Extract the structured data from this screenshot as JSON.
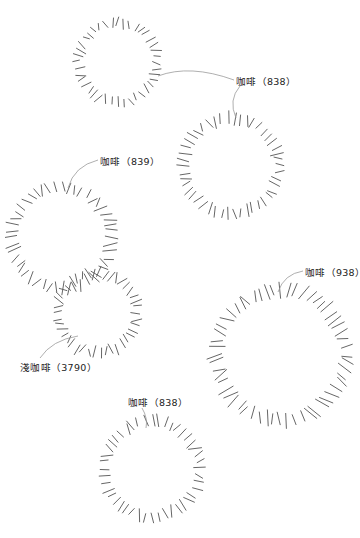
{
  "canvas": {
    "width": 360,
    "height": 538,
    "background": "#ffffff",
    "stroke": "#555555",
    "leader": "#9a9a9a"
  },
  "circles": [
    {
      "id": "c1",
      "cx": 118,
      "cy": 62,
      "r": 40,
      "ticks": 40,
      "len": 9
    },
    {
      "id": "c2",
      "cx": 231,
      "cy": 166,
      "r": 48,
      "ticks": 46,
      "len": 11
    },
    {
      "id": "c3",
      "cx": 62,
      "cy": 238,
      "r": 50,
      "ticks": 48,
      "len": 12
    },
    {
      "id": "c4",
      "cx": 97,
      "cy": 313,
      "r": 40,
      "ticks": 42,
      "len": 10
    },
    {
      "id": "c5",
      "cx": 281,
      "cy": 355,
      "r": 65,
      "ticks": 56,
      "len": 14
    },
    {
      "id": "c6",
      "cx": 152,
      "cy": 469,
      "r": 48,
      "ticks": 44,
      "len": 11
    }
  ],
  "labels": [
    {
      "id": "l1",
      "text": "咖啡（838）",
      "x": 236,
      "y": 74,
      "leaders": [
        {
          "d": "M158 76 Q190 64 234 80"
        },
        {
          "d": "M240 86 Q228 100 236 118"
        }
      ]
    },
    {
      "id": "l2",
      "text": "咖啡（839）",
      "x": 100,
      "y": 154,
      "leaders": [
        {
          "d": "M98 160 Q74 166 68 188"
        }
      ]
    },
    {
      "id": "l3",
      "text": "淺咖啡（3790）",
      "x": 20,
      "y": 360,
      "leaders": [
        {
          "d": "M40 358 Q52 340 78 336"
        }
      ]
    },
    {
      "id": "l4",
      "text": "咖啡（938）",
      "x": 305,
      "y": 265,
      "leaders": [
        {
          "d": "M303 271 Q284 274 278 292"
        }
      ]
    },
    {
      "id": "l5",
      "text": "咖啡（838）",
      "x": 128,
      "y": 395,
      "leaders": [
        {
          "d": "M142 408 Q148 418 146 428"
        }
      ]
    }
  ]
}
